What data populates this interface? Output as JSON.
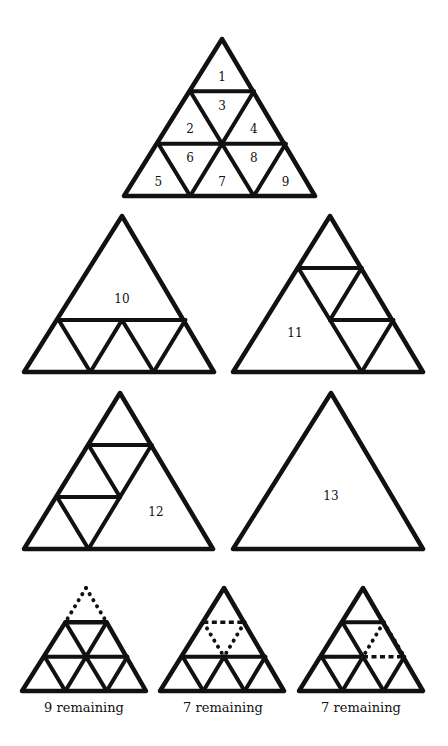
{
  "diagram": {
    "stroke_color": "#111111",
    "background": "#ffffff"
  },
  "figures": [
    {
      "id": "full-grid",
      "apex": [
        222,
        39
      ],
      "base_left": [
        124,
        196
      ],
      "base_right": [
        315,
        196
      ],
      "levels": 3,
      "edges": [
        [
          [
            1,
            0
          ],
          [
            1,
            1
          ]
        ],
        [
          [
            2,
            0
          ],
          [
            2,
            2
          ]
        ],
        [
          [
            1,
            0
          ],
          [
            2,
            1
          ]
        ],
        [
          [
            2,
            1
          ],
          [
            3,
            2
          ]
        ],
        [
          [
            1,
            1
          ],
          [
            2,
            1
          ]
        ],
        [
          [
            2,
            1
          ],
          [
            3,
            1
          ]
        ],
        [
          [
            2,
            0
          ],
          [
            3,
            1
          ]
        ],
        [
          [
            2,
            2
          ],
          [
            3,
            2
          ]
        ]
      ],
      "labels": [
        {
          "text": "1",
          "cell": [
            0,
            0,
            "up"
          ]
        },
        {
          "text": "2",
          "cell": [
            1,
            0,
            "up"
          ]
        },
        {
          "text": "3",
          "cell": [
            1,
            0,
            "down"
          ]
        },
        {
          "text": "4",
          "cell": [
            1,
            1,
            "up"
          ]
        },
        {
          "text": "5",
          "cell": [
            2,
            0,
            "up"
          ]
        },
        {
          "text": "6",
          "cell": [
            2,
            0,
            "down"
          ]
        },
        {
          "text": "7",
          "cell": [
            2,
            1,
            "up"
          ]
        },
        {
          "text": "8",
          "cell": [
            2,
            1,
            "down"
          ]
        },
        {
          "text": "9",
          "cell": [
            2,
            2,
            "up"
          ]
        }
      ]
    },
    {
      "id": "big-top",
      "apex": [
        122,
        216
      ],
      "base_left": [
        24,
        372
      ],
      "base_right": [
        214,
        372
      ],
      "levels": 3,
      "edges": [
        [
          [
            2,
            0
          ],
          [
            2,
            2
          ]
        ],
        [
          [
            2,
            0
          ],
          [
            3,
            1
          ]
        ],
        [
          [
            2,
            1
          ],
          [
            3,
            2
          ]
        ],
        [
          [
            2,
            1
          ],
          [
            3,
            1
          ]
        ],
        [
          [
            2,
            2
          ],
          [
            3,
            2
          ]
        ]
      ],
      "labels": [
        {
          "text": "10",
          "pos": [
            122,
            299
          ]
        }
      ]
    },
    {
      "id": "big-left",
      "apex": [
        330,
        216
      ],
      "base_left": [
        233,
        372
      ],
      "base_right": [
        423,
        372
      ],
      "levels": 3,
      "edges": [
        [
          [
            1,
            0
          ],
          [
            1,
            1
          ]
        ],
        [
          [
            2,
            1
          ],
          [
            2,
            2
          ]
        ],
        [
          [
            1,
            0
          ],
          [
            3,
            2
          ]
        ],
        [
          [
            1,
            1
          ],
          [
            2,
            1
          ]
        ],
        [
          [
            2,
            2
          ],
          [
            3,
            2
          ]
        ]
      ],
      "labels": [
        {
          "text": "11",
          "pos": [
            295,
            333
          ]
        }
      ]
    },
    {
      "id": "big-right",
      "apex": [
        120,
        393
      ],
      "base_left": [
        24,
        549
      ],
      "base_right": [
        213,
        549
      ],
      "levels": 3,
      "edges": [
        [
          [
            1,
            0
          ],
          [
            1,
            1
          ]
        ],
        [
          [
            2,
            0
          ],
          [
            2,
            1
          ]
        ],
        [
          [
            1,
            1
          ],
          [
            3,
            1
          ]
        ],
        [
          [
            1,
            0
          ],
          [
            2,
            1
          ]
        ],
        [
          [
            2,
            0
          ],
          [
            3,
            1
          ]
        ]
      ],
      "labels": [
        {
          "text": "12",
          "pos": [
            156,
            512
          ]
        }
      ]
    },
    {
      "id": "whole",
      "apex": [
        331,
        393
      ],
      "base_left": [
        233,
        549
      ],
      "base_right": [
        423,
        549
      ],
      "levels": 3,
      "edges": [],
      "labels": [
        {
          "text": "13",
          "pos": [
            331,
            496
          ]
        }
      ]
    },
    {
      "id": "remove-top",
      "apex": [
        86,
        588
      ],
      "base_left": [
        22,
        691
      ],
      "base_right": [
        146,
        691
      ],
      "levels": 3,
      "top_removed": true,
      "edges": [
        [
          [
            2,
            0
          ],
          [
            2,
            2
          ]
        ],
        [
          [
            1,
            0
          ],
          [
            2,
            1
          ]
        ],
        [
          [
            2,
            1
          ],
          [
            3,
            2
          ]
        ],
        [
          [
            1,
            1
          ],
          [
            2,
            1
          ]
        ],
        [
          [
            2,
            1
          ],
          [
            3,
            1
          ]
        ],
        [
          [
            2,
            0
          ],
          [
            3,
            1
          ]
        ],
        [
          [
            2,
            2
          ],
          [
            3,
            2
          ]
        ]
      ],
      "dotted": [
        [
          [
            0,
            0
          ],
          [
            1,
            0
          ]
        ],
        [
          [
            0,
            0
          ],
          [
            1,
            1
          ]
        ]
      ],
      "dashed": [
        [
          [
            1,
            0
          ],
          [
            1,
            1
          ]
        ]
      ],
      "caption": "9 remaining"
    },
    {
      "id": "remove-center-down",
      "apex": [
        224,
        588
      ],
      "base_left": [
        160,
        691
      ],
      "base_right": [
        284,
        691
      ],
      "levels": 3,
      "edges": [
        [
          [
            2,
            0
          ],
          [
            2,
            2
          ]
        ],
        [
          [
            2,
            1
          ],
          [
            3,
            1
          ]
        ],
        [
          [
            2,
            1
          ],
          [
            3,
            2
          ]
        ],
        [
          [
            2,
            0
          ],
          [
            3,
            1
          ]
        ],
        [
          [
            2,
            2
          ],
          [
            3,
            2
          ]
        ]
      ],
      "dotted": [
        [
          [
            1,
            0
          ],
          [
            2,
            1
          ]
        ],
        [
          [
            1,
            1
          ],
          [
            2,
            1
          ]
        ]
      ],
      "dashed": [
        [
          [
            1,
            0
          ],
          [
            1,
            1
          ]
        ]
      ],
      "caption": "7 remaining"
    },
    {
      "id": "remove-right-up",
      "apex": [
        363,
        588
      ],
      "base_left": [
        299,
        691
      ],
      "base_right": [
        423,
        691
      ],
      "levels": 3,
      "edges": [
        [
          [
            1,
            0
          ],
          [
            1,
            1
          ]
        ],
        [
          [
            2,
            0
          ],
          [
            2,
            1
          ]
        ],
        [
          [
            1,
            0
          ],
          [
            2,
            1
          ]
        ],
        [
          [
            2,
            1
          ],
          [
            3,
            2
          ]
        ],
        [
          [
            2,
            1
          ],
          [
            3,
            1
          ]
        ],
        [
          [
            2,
            0
          ],
          [
            3,
            1
          ]
        ],
        [
          [
            2,
            2
          ],
          [
            3,
            2
          ]
        ]
      ],
      "dotted": [
        [
          [
            1,
            1
          ],
          [
            2,
            1
          ]
        ],
        [
          [
            1,
            1
          ],
          [
            2,
            2
          ]
        ]
      ],
      "dashed": [
        [
          [
            2,
            1
          ],
          [
            2,
            2
          ]
        ]
      ],
      "caption": "7 remaining"
    }
  ],
  "captions": [
    "9 remaining",
    "7 remaining",
    "7 remaining"
  ]
}
